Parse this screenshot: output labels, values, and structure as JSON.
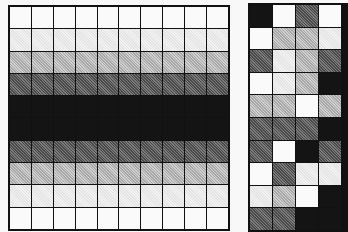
{
  "figure": {
    "shade_levels": {
      "0": "#fafafa",
      "1": "#ececec",
      "2": "#bcbcbc",
      "3": "#626262",
      "4": "#141414"
    },
    "left_grid": {
      "columns": 10,
      "rows": 10,
      "row_levels": [
        0,
        1,
        2,
        3,
        4,
        4,
        3,
        2,
        1,
        0
      ]
    },
    "right_grid": {
      "visible_columns": 4,
      "rows": 10,
      "cells": [
        [
          4,
          0,
          3,
          0
        ],
        [
          0,
          2,
          2,
          1
        ],
        [
          3,
          1,
          2,
          3
        ],
        [
          0,
          1,
          2,
          4
        ],
        [
          2,
          2,
          0,
          2
        ],
        [
          3,
          3,
          3,
          4
        ],
        [
          3,
          0,
          4,
          3
        ],
        [
          0,
          3,
          1,
          1
        ],
        [
          1,
          2,
          0,
          4
        ],
        [
          3,
          3,
          4,
          4
        ]
      ]
    }
  }
}
